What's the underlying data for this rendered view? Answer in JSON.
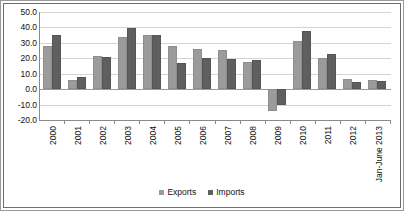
{
  "chart_data": {
    "type": "bar",
    "title": "",
    "subtitle": "",
    "xlabel": "",
    "ylabel": "",
    "ylim": [
      -20.0,
      50.0
    ],
    "ytick_step": 10.0,
    "ytick_labels": [
      "50.0",
      "40.0",
      "30.0",
      "20.0",
      "10.0",
      "0.0",
      "-10.0",
      "-20.0"
    ],
    "ytick_values": [
      50.0,
      40.0,
      30.0,
      20.0,
      10.0,
      0.0,
      -10.0,
      -20.0
    ],
    "grid": true,
    "legend_position": "bottom",
    "categories": [
      "2000",
      "2001",
      "2002",
      "2003",
      "2004",
      "2005",
      "2006",
      "2007",
      "2008",
      "2009",
      "2010",
      "2011",
      "2012",
      "Jan-June 2013"
    ],
    "series": [
      {
        "name": "Exports",
        "color": "#9b9b9b",
        "values": [
          27.8,
          6.1,
          21.8,
          34.1,
          34.8,
          27.8,
          25.9,
          25.4,
          17.9,
          -14.2,
          30.9,
          20.2,
          6.8,
          5.9
        ]
      },
      {
        "name": "Imports",
        "color": "#5f5f5f",
        "values": [
          35.0,
          7.6,
          20.9,
          39.8,
          35.4,
          16.9,
          19.9,
          19.6,
          19.1,
          -10.1,
          38.0,
          23.0,
          4.8,
          5.3
        ]
      }
    ]
  },
  "legend": {
    "items": [
      {
        "label": "Exports"
      },
      {
        "label": "Imports"
      }
    ]
  }
}
